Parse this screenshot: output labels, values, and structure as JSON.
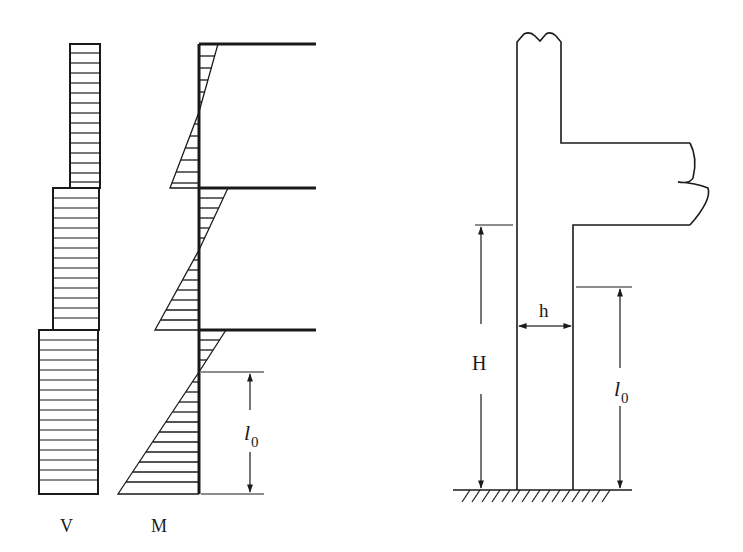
{
  "figure": {
    "colors": {
      "line": "#1a1a1a",
      "background": "#ffffff"
    }
  },
  "left_panel": {
    "shear_label": "V",
    "moment_label": "M",
    "effective_length_label": "l",
    "effective_length_subscript": "0",
    "stories": 3,
    "shear_blocks": [
      {
        "story": "top",
        "x_left": 70,
        "x_right": 100,
        "y_top": 44,
        "y_bottom": 188
      },
      {
        "story": "middle",
        "x_left": 53,
        "x_right": 99,
        "y_top": 188,
        "y_bottom": 330
      },
      {
        "story": "bottom",
        "x_left": 39,
        "x_right": 98,
        "y_top": 330,
        "y_bottom": 494
      }
    ],
    "moment_triangles": [
      {
        "story": "top",
        "top_right_x": 218,
        "inflection_y": 112,
        "bottom_left_x": 170
      },
      {
        "story": "middle",
        "top_right_x": 228,
        "inflection_y": 250,
        "bottom_left_x": 155
      },
      {
        "story": "bottom",
        "top_right_x": 226,
        "inflection_y": 372,
        "bottom_left_x": 118
      }
    ],
    "beam_levels_y": [
      44,
      188,
      330
    ],
    "base_y": 494
  },
  "right_panel": {
    "height_label": "H",
    "width_label": "h",
    "effective_length_label": "l",
    "effective_length_subscript": "0",
    "column": {
      "x_left": 517,
      "x_right": 573,
      "y_top": 38,
      "y_base": 490
    },
    "beam": {
      "y_top": 143,
      "y_bottom": 225,
      "x_end": 690
    },
    "ground": {
      "x_start": 453,
      "x_end": 632,
      "y": 490
    }
  }
}
